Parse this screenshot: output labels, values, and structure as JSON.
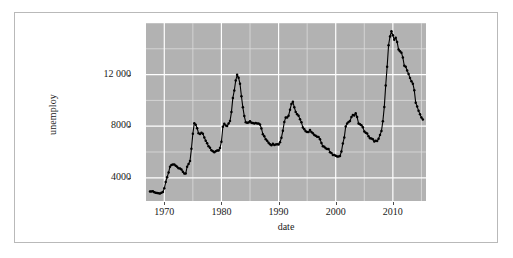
{
  "chart": {
    "type": "line",
    "title": "",
    "xlabel": "date",
    "ylabel": "unemploy",
    "y_ticks": [
      "4000",
      "8000",
      "12 000"
    ],
    "y_tick_values": [
      4000,
      8000,
      12000
    ],
    "x_ticks": [
      "1970",
      "1980",
      "1990",
      "2000",
      "2010"
    ],
    "x_tick_values": [
      1970,
      1980,
      1990,
      2000,
      2010
    ],
    "xlim": [
      1966.8,
      2015.8
    ],
    "ylim": [
      2200,
      16000
    ],
    "grid": true,
    "legend": "none",
    "panel_background": "#b2b2b2",
    "major_gridline_color": "#ffffff",
    "minor_gridline_color": "#dcdcdc",
    "line_color": "#000000",
    "point_color": "#000000",
    "frame_color": "#b9b9b9",
    "page_background": "#ffffff"
  },
  "chart_data": {
    "type": "line",
    "title": "",
    "xlabel": "date",
    "ylabel": "unemploy",
    "xlim": [
      1966.8,
      2015.8
    ],
    "ylim": [
      2200,
      16000
    ],
    "grid": true,
    "legend_position": "none",
    "series": [
      {
        "name": "unemploy",
        "x": [
          1967.5,
          1967.75,
          1968.0,
          1968.25,
          1968.5,
          1968.75,
          1969.0,
          1969.25,
          1969.5,
          1969.75,
          1970.0,
          1970.25,
          1970.5,
          1970.75,
          1971.0,
          1971.25,
          1971.5,
          1971.75,
          1972.0,
          1972.25,
          1972.5,
          1972.75,
          1973.0,
          1973.25,
          1973.5,
          1973.75,
          1974.0,
          1974.25,
          1974.5,
          1974.75,
          1975.0,
          1975.25,
          1975.5,
          1975.75,
          1976.0,
          1976.25,
          1976.5,
          1976.75,
          1977.0,
          1977.25,
          1977.5,
          1977.75,
          1978.0,
          1978.25,
          1978.5,
          1978.75,
          1979.0,
          1979.25,
          1979.5,
          1979.75,
          1980.0,
          1980.25,
          1980.5,
          1980.75,
          1981.0,
          1981.25,
          1981.5,
          1981.75,
          1982.0,
          1982.25,
          1982.5,
          1982.75,
          1983.0,
          1983.25,
          1983.5,
          1983.75,
          1984.0,
          1984.25,
          1984.5,
          1984.75,
          1985.0,
          1985.25,
          1985.5,
          1985.75,
          1986.0,
          1986.25,
          1986.5,
          1986.75,
          1987.0,
          1987.25,
          1987.5,
          1987.75,
          1988.0,
          1988.25,
          1988.5,
          1988.75,
          1989.0,
          1989.25,
          1989.5,
          1989.75,
          1990.0,
          1990.25,
          1990.5,
          1990.75,
          1991.0,
          1991.25,
          1991.5,
          1991.75,
          1992.0,
          1992.25,
          1992.5,
          1992.75,
          1993.0,
          1993.25,
          1993.5,
          1993.75,
          1994.0,
          1994.25,
          1994.5,
          1994.75,
          1995.0,
          1995.25,
          1995.5,
          1995.75,
          1996.0,
          1996.25,
          1996.5,
          1996.75,
          1997.0,
          1997.25,
          1997.5,
          1997.75,
          1998.0,
          1998.25,
          1998.5,
          1998.75,
          1999.0,
          1999.25,
          1999.5,
          1999.75,
          2000.0,
          2000.25,
          2000.5,
          2000.75,
          2001.0,
          2001.25,
          2001.5,
          2001.75,
          2002.0,
          2002.25,
          2002.5,
          2002.75,
          2003.0,
          2003.25,
          2003.5,
          2003.75,
          2004.0,
          2004.25,
          2004.5,
          2004.75,
          2005.0,
          2005.25,
          2005.5,
          2005.75,
          2006.0,
          2006.25,
          2006.5,
          2006.75,
          2007.0,
          2007.25,
          2007.5,
          2007.75,
          2008.0,
          2008.25,
          2008.5,
          2008.75,
          2009.0,
          2009.25,
          2009.5,
          2009.75,
          2010.0,
          2010.25,
          2010.5,
          2010.75,
          2011.0,
          2011.25,
          2011.5,
          2011.75,
          2012.0,
          2012.25,
          2012.5,
          2012.75,
          2013.0,
          2013.25,
          2013.5,
          2013.75,
          2014.0,
          2014.25,
          2014.5,
          2014.75,
          2015.0,
          2015.25
        ],
        "y": [
          2944,
          2945,
          2958,
          2883,
          2834,
          2816,
          2802,
          2774,
          2838,
          2890,
          3179,
          3672,
          4049,
          4400,
          4857,
          4996,
          5032,
          5033,
          4942,
          4864,
          4734,
          4716,
          4644,
          4470,
          4325,
          4326,
          4863,
          5073,
          5297,
          6243,
          7423,
          8230,
          8120,
          7844,
          7452,
          7398,
          7497,
          7423,
          7131,
          6870,
          6672,
          6452,
          6327,
          6141,
          6057,
          5987,
          6048,
          6121,
          6108,
          6308,
          6798,
          7960,
          8194,
          8046,
          8008,
          8215,
          8397,
          9093,
          10193,
          10766,
          11534,
          11986,
          11750,
          11290,
          10325,
          9459,
          8782,
          8310,
          8258,
          8294,
          8387,
          8268,
          8254,
          8199,
          8251,
          8211,
          8202,
          8127,
          7830,
          7378,
          7216,
          6997,
          6880,
          6716,
          6609,
          6528,
          6631,
          6540,
          6586,
          6596,
          6590,
          6752,
          7105,
          7645,
          8316,
          8681,
          8679,
          8811,
          9266,
          9727,
          9892,
          9472,
          9100,
          8933,
          8800,
          8547,
          8302,
          7906,
          7771,
          7606,
          7540,
          7546,
          7702,
          7540,
          7451,
          7322,
          7250,
          7186,
          7159,
          6993,
          6701,
          6441,
          6412,
          6290,
          6241,
          6234,
          5983,
          5919,
          5775,
          5764,
          5708,
          5641,
          5655,
          5691,
          6033,
          6660,
          7131,
          7982,
          8218,
          8332,
          8399,
          8709,
          8865,
          8834,
          9012,
          8711,
          8215,
          8147,
          8073,
          7914,
          7597,
          7498,
          7428,
          7212,
          7064,
          7042,
          6991,
          6807,
          6872,
          6842,
          7029,
          7325,
          7619,
          8383,
          9496,
          11163,
          12613,
          14281,
          14954,
          15352,
          15046,
          14698,
          14861,
          14534,
          13940,
          13803,
          13703,
          13316,
          12684,
          12607,
          12322,
          12044,
          11745,
          11484,
          11297,
          10787,
          9824,
          9533,
          9188,
          8929,
          8678,
          8510
        ]
      }
    ]
  }
}
